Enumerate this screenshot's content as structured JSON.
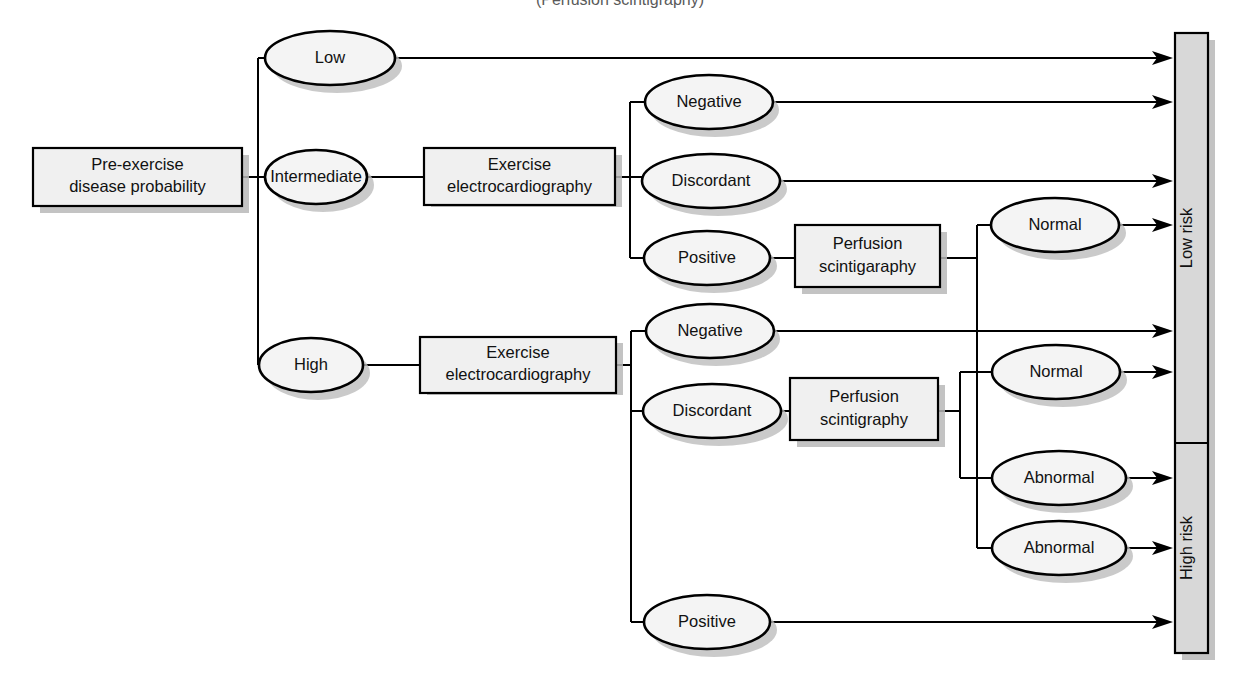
{
  "figure": {
    "type": "flowchart",
    "topic": "Diagnostic strategy for coronary artery disease based on pre-exercise disease probability",
    "clipped_title": "(Perfusion scintigraphy)",
    "orientation": "left-to-right"
  },
  "nodes": {
    "root_box": {
      "line1": "Pre-exercise",
      "line2": "disease probability"
    },
    "probability_levels": [
      {
        "id": "low",
        "label": "Low"
      },
      {
        "id": "intermediate",
        "label": "Intermediate"
      },
      {
        "id": "high",
        "label": "High"
      }
    ],
    "test_boxes": [
      {
        "id": "ecg_intermediate",
        "line1": "Exercise",
        "line2": "electrocardiography"
      },
      {
        "id": "ecg_high",
        "line1": "Exercise",
        "line2": "electrocardiography"
      },
      {
        "id": "perfusion_upper",
        "line1": "Perfusion",
        "line2": "scintigaraphy"
      },
      {
        "id": "perfusion_lower",
        "line1": "Perfusion",
        "line2": "scintigraphy"
      }
    ],
    "ecg_results_intermediate": [
      {
        "id": "int_negative",
        "label": "Negative"
      },
      {
        "id": "int_discordant",
        "label": "Discordant"
      },
      {
        "id": "int_positive",
        "label": "Positive"
      }
    ],
    "ecg_results_high": [
      {
        "id": "high_negative",
        "label": "Negative"
      },
      {
        "id": "high_discordant",
        "label": "Discordant"
      },
      {
        "id": "high_positive",
        "label": "Positive"
      }
    ],
    "perfusion_results": [
      {
        "id": "perf_upper_normal",
        "label": "Normal"
      },
      {
        "id": "perf_lower_normal",
        "label": "Normal"
      },
      {
        "id": "perf_lower_abnormal",
        "label": "Abnormal"
      },
      {
        "id": "perf_upper_abnormal",
        "label": "Abnormal"
      }
    ]
  },
  "outcome_bar": {
    "segments": [
      {
        "id": "low-risk",
        "label": "Low risk"
      },
      {
        "id": "high-risk",
        "label": "High risk"
      }
    ]
  },
  "colors": {
    "node_fill": "#f0f0f0",
    "ellipse_fill": "#f4f4f4",
    "bar_fill": "#d8d8d8",
    "stroke": "#000000",
    "shadow": "#b9b9b9",
    "text": "#111111"
  }
}
